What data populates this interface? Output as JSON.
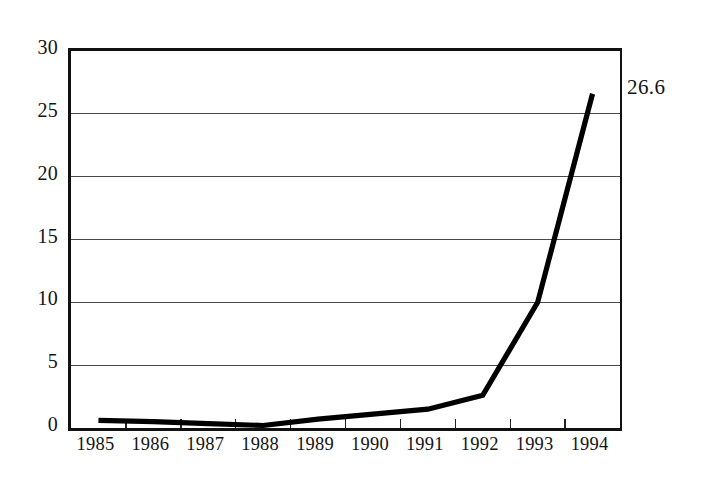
{
  "chart_data": {
    "type": "line",
    "title": "",
    "subtitle": "",
    "xlabel": "",
    "ylabel": "",
    "categories": [
      "1985",
      "1986",
      "1987",
      "1988",
      "1989",
      "1990",
      "1991",
      "1992",
      "1993",
      "1994"
    ],
    "x": [
      1985,
      1986,
      1987,
      1988,
      1989,
      1990,
      1991,
      1992,
      1993,
      1994
    ],
    "values": [
      0.6,
      0.5,
      0.35,
      0.2,
      0.7,
      1.1,
      1.5,
      2.6,
      10.0,
      26.6
    ],
    "series": [
      {
        "name": "",
        "values": [
          0.6,
          0.5,
          0.35,
          0.2,
          0.7,
          1.1,
          1.5,
          2.6,
          10.0,
          26.6
        ],
        "color": "#000000"
      }
    ],
    "ylim": [
      0,
      30
    ],
    "yticks": [
      0,
      5,
      10,
      15,
      20,
      25,
      30
    ],
    "ytick_labels": [
      "0",
      "5",
      "10",
      "15",
      "20",
      "25",
      "30"
    ],
    "xtick_labels": [
      "1985",
      "1986",
      "1987",
      "1988",
      "1989",
      "1990",
      "1991",
      "1992",
      "1993",
      "1994"
    ],
    "grid": true,
    "grid_axis": "y",
    "legend": false,
    "legend_position": "none",
    "annotations": [
      {
        "text": "26.6",
        "x": 1994,
        "y": 26.6,
        "position": "right-of-endpoint"
      }
    ],
    "colors": {
      "line": "#000000",
      "grid": "#4a4a4a",
      "axis": "#111111",
      "background": "#ffffff",
      "text": "#141414"
    }
  },
  "annotation": {
    "endpoint_value": "26.6"
  }
}
